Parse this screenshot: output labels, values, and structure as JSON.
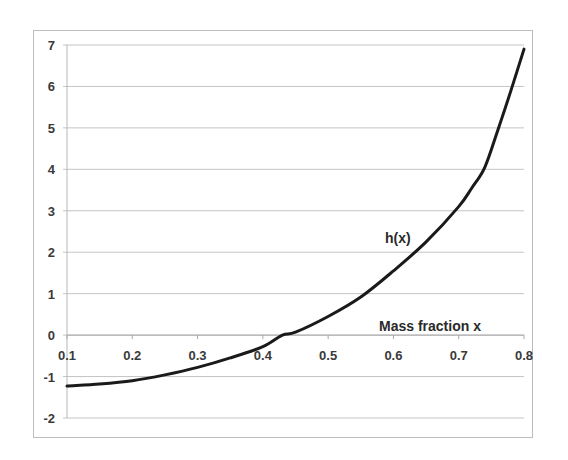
{
  "chart_data": {
    "type": "line",
    "title": "",
    "xlabel": "Mass fraction x",
    "ylabel": "",
    "xlim": [
      0.1,
      0.8
    ],
    "ylim": [
      -2,
      7
    ],
    "x_ticks": [
      "0.1",
      "0.2",
      "0.3",
      "0.4",
      "0.5",
      "0.6",
      "0.7",
      "0.8"
    ],
    "y_ticks": [
      "7",
      "6",
      "5",
      "4",
      "3",
      "2",
      "1",
      "0",
      "-1",
      "-2"
    ],
    "grid": {
      "horizontal": true,
      "vertical": false
    },
    "legend": null,
    "annotations": [
      {
        "text": "h(x)",
        "near_x": 0.63,
        "near_y": 2.4
      },
      {
        "text": "Mass fraction x",
        "near_x": 0.68,
        "near_y": 0.25
      }
    ],
    "series": [
      {
        "name": "h(x)",
        "color": "#1a1a1a",
        "x": [
          0.1,
          0.15,
          0.2,
          0.25,
          0.3,
          0.35,
          0.4,
          0.43,
          0.45,
          0.5,
          0.55,
          0.6,
          0.65,
          0.7,
          0.72,
          0.74,
          0.76,
          0.78,
          0.8
        ],
        "y": [
          -1.23,
          -1.18,
          -1.1,
          -0.96,
          -0.78,
          -0.55,
          -0.28,
          0.0,
          0.07,
          0.45,
          0.92,
          1.55,
          2.25,
          3.1,
          3.55,
          4.05,
          4.95,
          5.9,
          6.9
        ]
      }
    ]
  }
}
